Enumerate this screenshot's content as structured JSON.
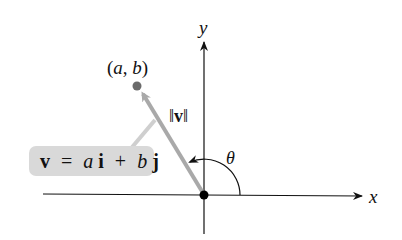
{
  "diagram": {
    "type": "vector-in-plane",
    "axes": {
      "x_label": "x",
      "y_label": "y"
    },
    "point": {
      "label": "(a, b)",
      "label_parts": [
        "(",
        "a",
        ", ",
        "b",
        ")"
      ],
      "color": "#6b6b6b"
    },
    "vector": {
      "magnitude_label": "||v||",
      "magnitude_bar": "‖",
      "magnitude_symbol": "v",
      "color": "#a9a9a9"
    },
    "callout": {
      "text": "v = ai + bj",
      "parts": {
        "v": "v",
        "eq": "=",
        "a": "a",
        "i": "i",
        "plus": "+",
        "b": "b",
        "j": "j"
      },
      "background": "#d9d9d9"
    },
    "angle": {
      "label": "θ"
    },
    "colors": {
      "axis": "#111111",
      "origin_dot": "#000000",
      "vector": "#a9a9a9",
      "callout_bg": "#d9d9d9",
      "point": "#6b6b6b"
    }
  }
}
